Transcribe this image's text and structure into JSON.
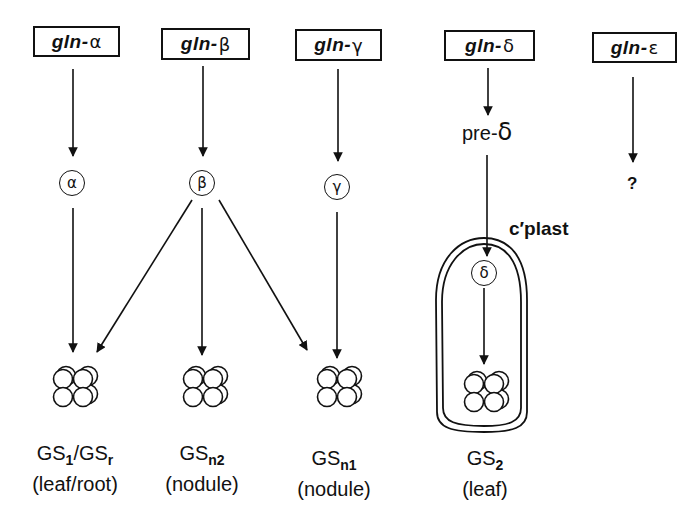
{
  "genes": [
    {
      "prefix": "gln-",
      "greek": "α",
      "name": "gln-alpha"
    },
    {
      "prefix": "gln-",
      "greek": "β",
      "name": "gln-beta"
    },
    {
      "prefix": "gln-",
      "greek": "γ",
      "name": "gln-gamma"
    },
    {
      "prefix": "gln-",
      "greek": "δ",
      "name": "gln-delta"
    },
    {
      "prefix": "gln-",
      "greek": "ε",
      "name": "gln-epsilon"
    }
  ],
  "polypeptides": {
    "alpha": "α",
    "beta": "β",
    "gamma": "γ",
    "delta": "δ",
    "epsilon_unknown": "?"
  },
  "precursor": {
    "prefix": "pre-",
    "greek": "δ"
  },
  "compartment_label": "c′plast",
  "isoenzymes": [
    {
      "base": "GS",
      "sub1": "1",
      "sep": "/GS",
      "sub2": "r",
      "tissue": "(leaf/root)"
    },
    {
      "base": "GS",
      "sub1": "n2",
      "tissue": "(nodule)"
    },
    {
      "base": "GS",
      "sub1": "n1",
      "tissue": "(nodule)"
    },
    {
      "base": "GS",
      "sub1": "2",
      "tissue": "(leaf)"
    }
  ]
}
